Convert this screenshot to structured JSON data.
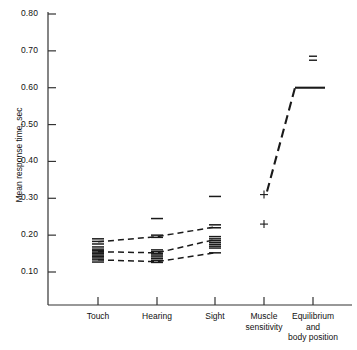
{
  "chart_data": {
    "type": "scatter",
    "title": "",
    "xlabel": "",
    "ylabel": "Mean response time, sec",
    "ylim": [
      0.0,
      0.8
    ],
    "yticks": [
      0.8,
      0.7,
      0.6,
      0.5,
      0.4,
      0.3,
      0.2,
      0.1
    ],
    "ytick_labels": [
      "0.80",
      "0.70",
      "0.60",
      "0.50",
      "0.40",
      "0.30",
      "0.20",
      "0.10"
    ],
    "grid": false,
    "legend": "none",
    "categories": [
      "Touch",
      "Hearing",
      "Sight",
      "Muscle sensitivity",
      "Equilibrium and body position"
    ],
    "category_labels": [
      [
        "Touch"
      ],
      [
        "Hearing"
      ],
      [
        "Sight"
      ],
      [
        "Muscle",
        "sensitivity"
      ],
      [
        "Equilibrium",
        "and",
        "body position"
      ]
    ],
    "series": [
      {
        "name": "upper trend",
        "style": "dashed",
        "x": [
          "Touch",
          "Hearing",
          "Sight"
        ],
        "values": [
          0.182,
          0.196,
          0.222
        ]
      },
      {
        "name": "middle trend",
        "style": "dashed",
        "x": [
          "Touch",
          "Hearing",
          "Sight"
        ],
        "values": [
          0.155,
          0.152,
          0.188
        ]
      },
      {
        "name": "lower trend",
        "style": "dashed",
        "x": [
          "Touch",
          "Hearing",
          "Sight"
        ],
        "values": [
          0.133,
          0.128,
          0.152
        ]
      },
      {
        "name": "equilibrium rise",
        "style": "dashed-to-solid",
        "x": [
          "Muscle sensitivity",
          "Equilibrium and body position"
        ],
        "values": [
          0.31,
          0.6
        ]
      }
    ],
    "point_clusters": [
      {
        "category": "Touch",
        "marker": "horizontal-dash",
        "values": [
          0.19,
          0.183,
          0.176,
          0.168,
          0.162,
          0.158,
          0.154,
          0.15,
          0.146,
          0.142,
          0.138,
          0.133,
          0.127
        ]
      },
      {
        "category": "Hearing",
        "marker": "horizontal-dash",
        "values": [
          0.245,
          0.2,
          0.194,
          0.16,
          0.155,
          0.15,
          0.146,
          0.141,
          0.136,
          0.131,
          0.126
        ]
      },
      {
        "category": "Sight",
        "marker": "horizontal-dash",
        "values": [
          0.305,
          0.228,
          0.22,
          0.196,
          0.19,
          0.185,
          0.18,
          0.175,
          0.17,
          0.165,
          0.152
        ]
      },
      {
        "category": "Muscle sensitivity",
        "marker": "plus",
        "values": [
          0.31,
          0.23
        ]
      },
      {
        "category": "Equilibrium and body position",
        "marker": "equals",
        "values": [
          0.68
        ]
      }
    ]
  },
  "colors": {
    "axis": "#333333",
    "data": "#1a1a1a",
    "background": "#ffffff"
  }
}
